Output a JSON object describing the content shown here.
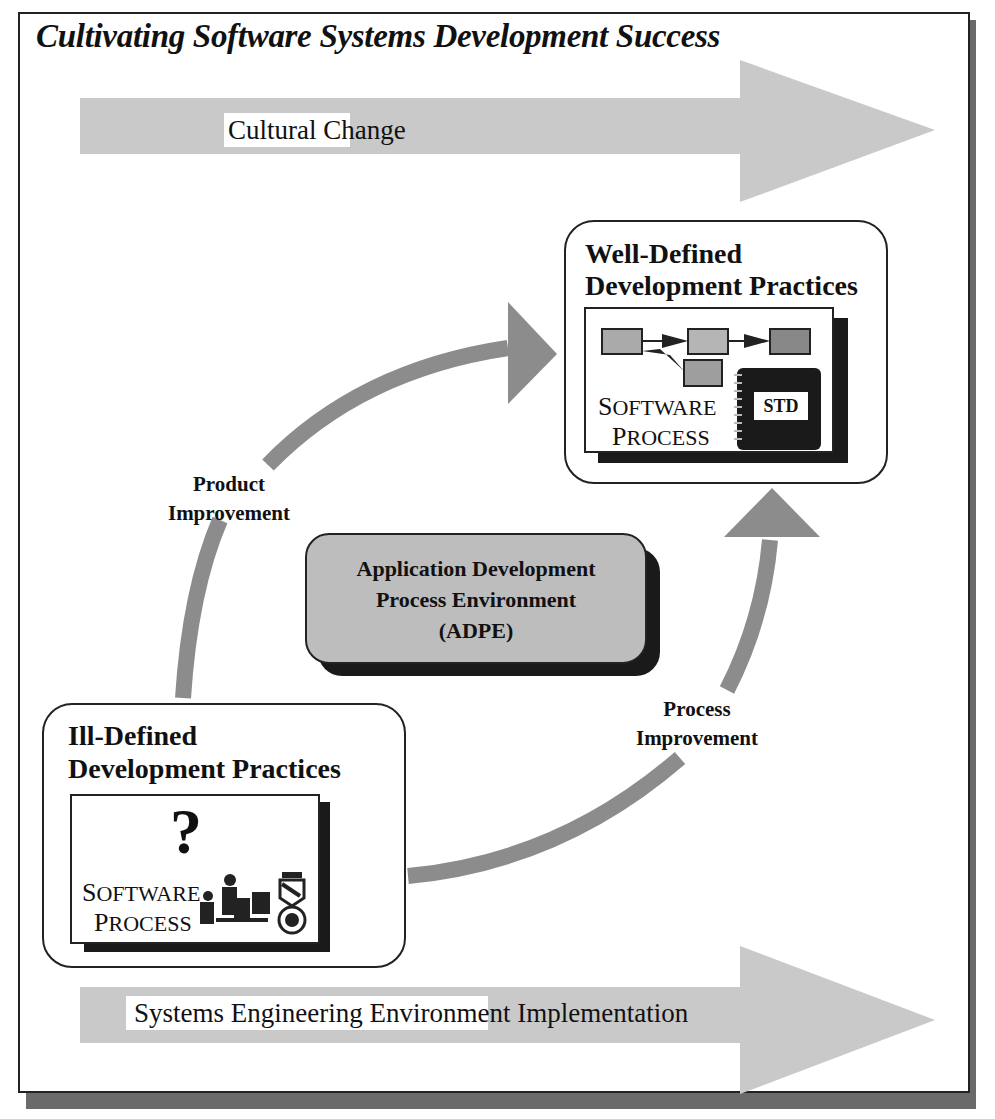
{
  "title": "Cultivating Software Systems Development Success",
  "banners": {
    "top": {
      "label": "Cultural Change",
      "color": "#c8c8c8"
    },
    "bottom": {
      "label": "Systems Engineering Environment Implementation",
      "color": "#c8c8c8"
    }
  },
  "states": {
    "well_defined": {
      "title_line1": "Well-Defined",
      "title_line2": "Development Practices",
      "panel_line1_cap": "S",
      "panel_line1_rest": "OFTWARE",
      "panel_line2_cap": "P",
      "panel_line2_rest": "ROCESS",
      "book_label": "STD",
      "icon": "process-flow-icon"
    },
    "ill_defined": {
      "title_line1": "Ill-Defined",
      "title_line2": "Development Practices",
      "panel_line1_cap": "S",
      "panel_line1_rest": "OFTWARE",
      "panel_line2_cap": "P",
      "panel_line2_rest": "ROCESS",
      "question": "?",
      "icon": "people-at-computers-icon"
    }
  },
  "center": {
    "line1": "Application Development",
    "line2": "Process Environment",
    "line3": "(ADPE)",
    "fill": "#bdbdbd"
  },
  "arcs": {
    "product": {
      "line1": "Product",
      "line2": "Improvement"
    },
    "process": {
      "line1": "Process",
      "line2": "Improvement"
    },
    "color": "#8c8c8c"
  }
}
